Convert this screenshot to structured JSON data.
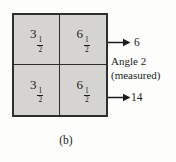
{
  "figure": {
    "caption": "(b)"
  },
  "grid": {
    "fill_color": "#d6d4d1",
    "border_color": "#2f2f2f",
    "cells": [
      {
        "position": "top-left",
        "whole": "3",
        "numerator": "1",
        "denominator": "2"
      },
      {
        "position": "top-right",
        "whole": "6",
        "numerator": "1",
        "denominator": "2"
      },
      {
        "position": "bottom-left",
        "whole": "3",
        "numerator": "1",
        "denominator": "2"
      },
      {
        "position": "bottom-right",
        "whole": "6",
        "numerator": "1",
        "denominator": "2"
      }
    ]
  },
  "annotations": {
    "top_arrow_value": "6",
    "angle_label_line1": "Angle 2",
    "angle_label_line2": "(measured)",
    "bottom_arrow_value": "14"
  }
}
